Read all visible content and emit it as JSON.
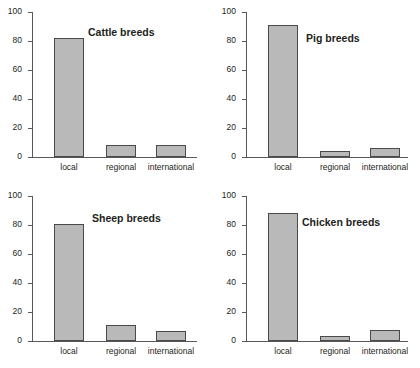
{
  "chart_data": [
    {
      "type": "bar",
      "title": "Cattle breeds",
      "categories": [
        "local",
        "regional",
        "international"
      ],
      "values": [
        82,
        8,
        8
      ],
      "xlabel": "",
      "ylabel": "",
      "ylim": [
        0,
        100
      ],
      "yticks": [
        0,
        20,
        40,
        60,
        80,
        100
      ],
      "grid": false,
      "legend": "none",
      "bar_color": "#b9b9b9",
      "bar_border_color": "#4a4a4c"
    },
    {
      "type": "bar",
      "title": "Pig breeds",
      "categories": [
        "local",
        "regional",
        "international"
      ],
      "values": [
        91,
        4,
        6
      ],
      "xlabel": "",
      "ylabel": "",
      "ylim": [
        0,
        100
      ],
      "yticks": [
        0,
        20,
        40,
        60,
        80,
        100
      ],
      "grid": false,
      "legend": "none",
      "bar_color": "#b9b9b9",
      "bar_border_color": "#4a4a4c"
    },
    {
      "type": "bar",
      "title": "Sheep breeds",
      "categories": [
        "local",
        "regional",
        "international"
      ],
      "values": [
        81,
        11,
        7
      ],
      "xlabel": "",
      "ylabel": "",
      "ylim": [
        0,
        100
      ],
      "yticks": [
        0,
        20,
        40,
        60,
        80,
        100
      ],
      "grid": false,
      "legend": "none",
      "bar_color": "#b9b9b9",
      "bar_border_color": "#4a4a4c"
    },
    {
      "type": "bar",
      "title": "Chicken breeds",
      "categories": [
        "local",
        "regional",
        "international"
      ],
      "values": [
        88,
        3.5,
        7.5
      ],
      "xlabel": "",
      "ylabel": "",
      "ylim": [
        0,
        100
      ],
      "yticks": [
        0,
        20,
        40,
        60,
        80,
        100
      ],
      "grid": false,
      "legend": "none",
      "bar_color": "#b9b9b9",
      "bar_border_color": "#4a4a4c"
    }
  ]
}
